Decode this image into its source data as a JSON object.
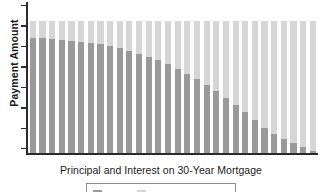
{
  "chart_data": {
    "type": "bar",
    "title": "",
    "subtitle": "",
    "xlabel": "Principal and Interest on 30-Year Mortgage",
    "ylabel": "Payment Amount",
    "stacked": true,
    "grid": false,
    "legend_position": "bottom",
    "axis": {
      "y_tick_labels": [],
      "y_tick_count": 8,
      "x_tick_labels": [],
      "ylim": [
        0,
        100
      ],
      "y_axis_visible": true,
      "x_axis_visible": true
    },
    "categories": [
      "1",
      "2",
      "3",
      "4",
      "5",
      "6",
      "7",
      "8",
      "9",
      "10",
      "11",
      "12",
      "13",
      "14",
      "15",
      "16",
      "17",
      "18",
      "19",
      "20",
      "21",
      "22",
      "23",
      "24",
      "25",
      "26",
      "27",
      "28",
      "29",
      "30"
    ],
    "series": [
      {
        "name": "Interest",
        "color": "#9a9a9a",
        "values": [
          87,
          86.5,
          86,
          85,
          84.5,
          84,
          83,
          82,
          80.5,
          79,
          77,
          75,
          72.5,
          70,
          67,
          63.5,
          60,
          56,
          51.5,
          47,
          42,
          36.5,
          31,
          25,
          19,
          14.5,
          11,
          7.5,
          4.5,
          2
        ]
      },
      {
        "name": "Principal",
        "color": "#d6d6d6",
        "values": [
          13,
          13.5,
          14,
          15,
          15.5,
          16,
          17,
          18,
          19.5,
          21,
          23,
          25,
          27.5,
          30,
          33,
          36.5,
          40,
          44,
          48.5,
          53,
          58,
          63.5,
          69,
          75,
          81,
          85.5,
          89,
          92.5,
          95.5,
          98
        ]
      }
    ],
    "total_constant": 100,
    "annotations": []
  },
  "legend": {
    "items": [
      {
        "label": "Interest",
        "color": "#9a9a9a"
      },
      {
        "label": "Principal",
        "color": "#d6d6d6"
      }
    ]
  },
  "colors": {
    "interest": "#9a9a9a",
    "principal": "#d6d6d6",
    "axis": "#2b2b2b",
    "text": "#1a1a1a",
    "background": "#ffffff",
    "legend_border": "#8d8d8d"
  }
}
